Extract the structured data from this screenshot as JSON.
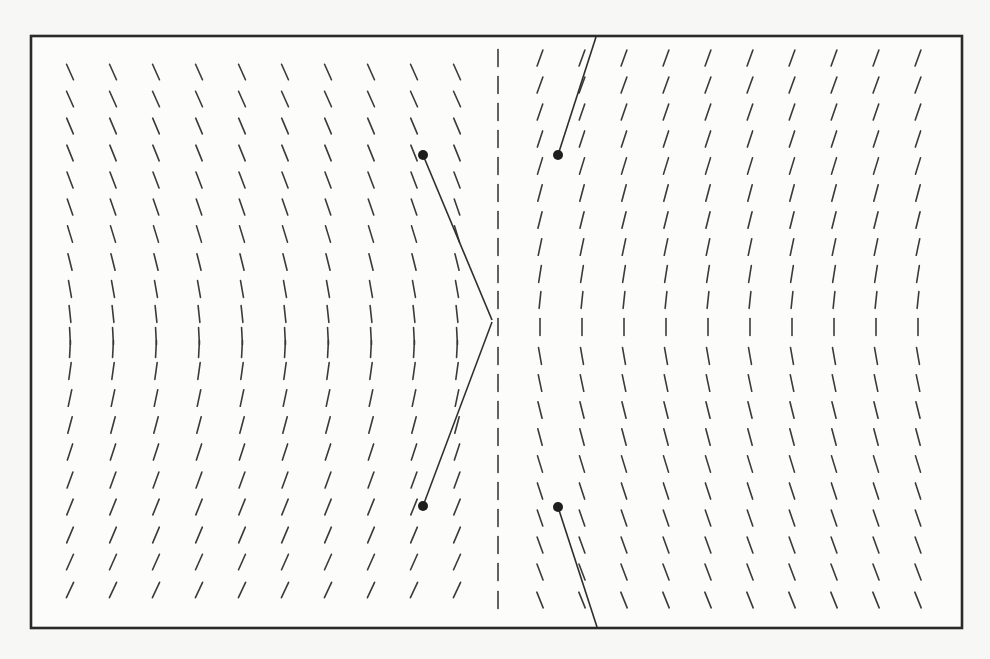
{
  "figure": {
    "title": "",
    "frame": {
      "x": 31,
      "y": 36,
      "width": 931,
      "height": 592
    },
    "colors": {
      "background": "#f7f7f5",
      "frame_fill": "#fcfcfb",
      "ink": "#2a2a2a"
    },
    "tick_length": 17,
    "left_field": {
      "columns_x": [
        70,
        113,
        156,
        199,
        242,
        285,
        328,
        371,
        414,
        457
      ],
      "rows": [
        {
          "y": 72,
          "tilt": -24
        },
        {
          "y": 99,
          "tilt": -24
        },
        {
          "y": 126,
          "tilt": -23
        },
        {
          "y": 153,
          "tilt": -22
        },
        {
          "y": 180,
          "tilt": -21
        },
        {
          "y": 207,
          "tilt": -19
        },
        {
          "y": 234,
          "tilt": -17
        },
        {
          "y": 262,
          "tilt": -14
        },
        {
          "y": 289,
          "tilt": -10
        },
        {
          "y": 314,
          "tilt": -6
        },
        {
          "y": 336,
          "tilt": -3
        },
        {
          "y": 349,
          "tilt": 3
        },
        {
          "y": 371,
          "tilt": 8
        },
        {
          "y": 398,
          "tilt": 12
        },
        {
          "y": 425,
          "tilt": 15
        },
        {
          "y": 452,
          "tilt": 18
        },
        {
          "y": 480,
          "tilt": 20
        },
        {
          "y": 507,
          "tilt": 22
        },
        {
          "y": 535,
          "tilt": 23
        },
        {
          "y": 562,
          "tilt": 24
        },
        {
          "y": 590,
          "tilt": 25
        }
      ]
    },
    "center_column": {
      "x": 498,
      "rows_y": [
        58,
        85,
        112,
        139,
        166,
        193,
        220,
        247,
        274,
        300,
        327,
        356,
        383,
        410,
        437,
        464,
        491,
        518,
        545,
        572,
        600
      ],
      "tilt": 0
    },
    "right_field": {
      "columns_x": [
        540,
        582,
        624,
        666,
        708,
        750,
        792,
        834,
        876,
        918
      ],
      "rows": [
        {
          "y": 58,
          "tilt": 20
        },
        {
          "y": 85,
          "tilt": 20
        },
        {
          "y": 112,
          "tilt": 19
        },
        {
          "y": 139,
          "tilt": 18
        },
        {
          "y": 166,
          "tilt": 17
        },
        {
          "y": 193,
          "tilt": 15
        },
        {
          "y": 220,
          "tilt": 14
        },
        {
          "y": 247,
          "tilt": 12
        },
        {
          "y": 274,
          "tilt": 9
        },
        {
          "y": 300,
          "tilt": 6
        },
        {
          "y": 327,
          "tilt": 0
        },
        {
          "y": 356,
          "tilt": -10
        },
        {
          "y": 383,
          "tilt": -12
        },
        {
          "y": 410,
          "tilt": -14
        },
        {
          "y": 437,
          "tilt": -15
        },
        {
          "y": 464,
          "tilt": -17
        },
        {
          "y": 491,
          "tilt": -18
        },
        {
          "y": 518,
          "tilt": -19
        },
        {
          "y": 545,
          "tilt": -20
        },
        {
          "y": 572,
          "tilt": -21
        },
        {
          "y": 600,
          "tilt": -22
        }
      ]
    },
    "long_lines": [
      {
        "name": "left-upper-line",
        "x1": 423,
        "y1": 155,
        "x2": 492,
        "y2": 320
      },
      {
        "name": "left-lower-line",
        "x1": 492,
        "y1": 322,
        "x2": 423,
        "y2": 506
      },
      {
        "name": "right-upper-line",
        "x1": 596,
        "y1": 37,
        "x2": 558,
        "y2": 155
      },
      {
        "name": "right-lower-line",
        "x1": 558,
        "y1": 507,
        "x2": 597,
        "y2": 627
      }
    ],
    "dots": [
      {
        "name": "dot-upper-left",
        "cx": 423,
        "cy": 155,
        "r": 5
      },
      {
        "name": "dot-upper-right",
        "cx": 558,
        "cy": 155,
        "r": 5
      },
      {
        "name": "dot-lower-left",
        "cx": 423,
        "cy": 506,
        "r": 5
      },
      {
        "name": "dot-lower-right",
        "cx": 558,
        "cy": 507,
        "r": 5
      }
    ]
  }
}
